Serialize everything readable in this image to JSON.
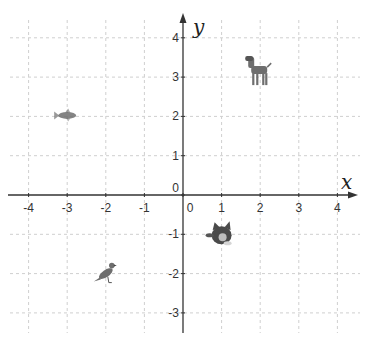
{
  "chart_data": {
    "type": "scatter",
    "title": "",
    "xlabel": "x",
    "ylabel": "y",
    "xlim": [
      -4.5,
      4.5
    ],
    "ylim": [
      -3.5,
      4.5
    ],
    "grid": true,
    "grid_style": "dashed light gray",
    "x_ticks": [
      -4,
      -3,
      -2,
      -1,
      0,
      1,
      2,
      3,
      4
    ],
    "y_ticks": [
      -3,
      -2,
      -1,
      0,
      1,
      2,
      3,
      4
    ],
    "x_tick_labels": [
      "-4",
      "-3",
      "-2",
      "-1",
      "0",
      "1",
      "2",
      "3",
      "4"
    ],
    "y_tick_labels": [
      "-3",
      "-2",
      "-1",
      "0",
      "1",
      "2",
      "3",
      "4"
    ],
    "points": [
      {
        "label": "fish",
        "x": -3,
        "y": 2,
        "icon": "fish-icon"
      },
      {
        "label": "dog",
        "x": 2,
        "y": 3,
        "icon": "dog-icon"
      },
      {
        "label": "cat",
        "x": 1,
        "y": -1,
        "icon": "cat-icon"
      },
      {
        "label": "bird",
        "x": -2,
        "y": -2,
        "icon": "bird-icon"
      }
    ]
  },
  "colors": {
    "axis": "#333333",
    "grid": "#cfcfcf",
    "animal": "#6e6e6e"
  }
}
